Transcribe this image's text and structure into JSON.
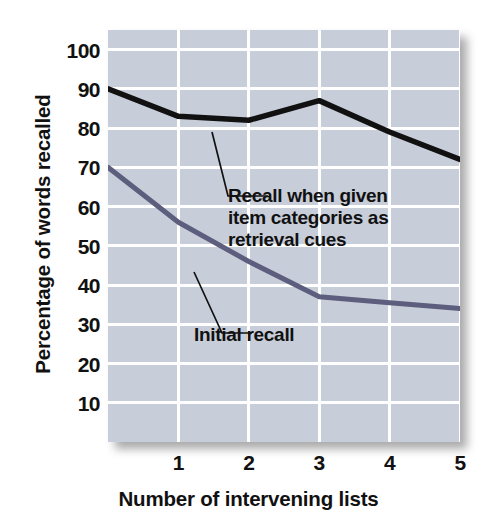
{
  "chart_data": {
    "type": "line",
    "title": "",
    "xlabel": "Number of intervening lists",
    "ylabel": "Percentage of words recalled",
    "x": [
      0,
      1,
      2,
      3,
      4,
      5
    ],
    "xtick_labels": [
      "1",
      "2",
      "3",
      "4",
      "5"
    ],
    "xtick_values": [
      1,
      2,
      3,
      4,
      5
    ],
    "ytick_labels": [
      "100",
      "90",
      "80",
      "70",
      "60",
      "50",
      "40",
      "30",
      "20",
      "10"
    ],
    "ytick_values": [
      100,
      90,
      80,
      70,
      60,
      50,
      40,
      30,
      20,
      10
    ],
    "xlim": [
      0,
      5
    ],
    "ylim": [
      0,
      105
    ],
    "grid": true,
    "legend": "annotations-inline",
    "series": [
      {
        "name": "Recall when given item categories as retrieval cues",
        "color": "#111111",
        "values": [
          90,
          83,
          82,
          87,
          79,
          72
        ]
      },
      {
        "name": "Initial recall",
        "color": "#5d5d7d",
        "values": [
          70,
          56,
          46,
          37,
          35.5,
          34
        ]
      }
    ],
    "annotations": [
      {
        "id": "cued",
        "lines": [
          "Recall when given",
          "item categories as",
          "retrieval cues"
        ],
        "points_to_series": "Recall when given item categories as retrieval cues"
      },
      {
        "id": "initial",
        "lines": [
          "Initial recall"
        ],
        "points_to_series": "Initial recall"
      }
    ],
    "colors": {
      "plot_background": "#c8cdda",
      "gridline": "#ffffff",
      "page_background": "#ffffff",
      "text": "#111111",
      "series_cued": "#111111",
      "series_initial": "#5d5d7d"
    }
  }
}
